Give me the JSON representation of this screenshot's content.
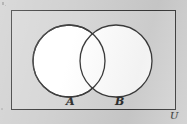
{
  "figure": {
    "kind": "venn-diagram",
    "background_color": "#cfcfcf",
    "universe_fill": "#d6d6d6",
    "set_fill": "#ffffff",
    "stroke_color": "#3a3a3a"
  },
  "universe": {
    "label": "U",
    "shape": "rectangle"
  },
  "sets": [
    {
      "label": "A",
      "shape": "circle",
      "cx": 69,
      "cy": 61,
      "r": 36
    },
    {
      "label": "B",
      "shape": "circle",
      "cx": 116,
      "cy": 61,
      "r": 36
    }
  ]
}
